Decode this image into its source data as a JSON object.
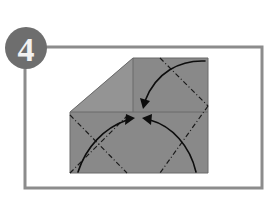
{
  "figure": {
    "kind": "origami-instruction-diagram",
    "step_label": "4",
    "background_color": "#ffffff"
  },
  "frame": {
    "name": "panel-border",
    "x": 25,
    "y": 47,
    "width": 237,
    "height": 141,
    "stroke_color": "#8c8c8c",
    "stroke_width": 3
  },
  "step_badge": {
    "name": "step-number-badge",
    "cx": 26,
    "cy": 48,
    "r": 21,
    "fill_color": "#6e6e6e",
    "text_color": "#f2f2f2",
    "label": "4"
  },
  "paper": {
    "name": "folded-paper",
    "body_color": "#898989",
    "flap_color": "#949494",
    "edge_color": "#6b6b6b",
    "left": 70,
    "top": 58,
    "right": 208,
    "bottom": 173,
    "apex_y": 112,
    "diagonal_top_x": 133
  },
  "fold_lines": {
    "name": "fold-crease-lines",
    "style": "dash-dot",
    "color": "#1a1a1a",
    "width": 1.2,
    "count": 4
  },
  "arrows": {
    "name": "fold-direction-arrows",
    "color": "#0d0d0d",
    "width": 1.6,
    "count": 4,
    "items": [
      {
        "name": "arrow-from-top-right",
        "direction": "down-left"
      },
      {
        "name": "arrow-from-bottom-left",
        "direction": "up-right"
      },
      {
        "name": "arrow-from-bottom-right",
        "direction": "up-left"
      },
      {
        "name": "arrow-lower-right-sweep",
        "direction": "up-left"
      }
    ]
  }
}
